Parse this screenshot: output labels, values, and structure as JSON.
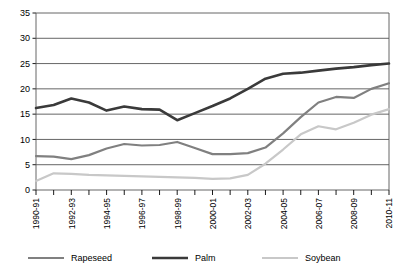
{
  "chart_data": {
    "type": "line",
    "title": "",
    "subtitle": "",
    "xlabel": "",
    "ylabel": "",
    "ylim": [
      0,
      35
    ],
    "ytick_values": [
      0,
      5,
      10,
      15,
      20,
      25,
      30,
      35
    ],
    "ytick_labels": [
      "0",
      "5",
      "10",
      "15",
      "20",
      "25",
      "30",
      "35"
    ],
    "grid": true,
    "legend_position": "bottom",
    "x": [
      "1990-91",
      "1991-92",
      "1992-93",
      "1993-94",
      "1994-95",
      "1995-96",
      "1996-97",
      "1997-98",
      "1998-99",
      "1999-00",
      "2000-01",
      "2001-02",
      "2002-03",
      "2003-04",
      "2004-05",
      "2005-06",
      "2006-07",
      "2007-08",
      "2008-09",
      "2009-10",
      "2010-11"
    ],
    "xtick_labels_shown": [
      "1990-91",
      "1992-93",
      "1994-95",
      "1996-97",
      "1998-99",
      "2000-01",
      "2002-03",
      "2004-05",
      "2006-07",
      "2008-09",
      "2010-11"
    ],
    "series": [
      {
        "name": "Rapeseed",
        "color": "#808080",
        "values": [
          6.7,
          6.6,
          6.1,
          6.9,
          8.2,
          9.1,
          8.8,
          8.9,
          9.5,
          8.3,
          7.1,
          7.1,
          7.3,
          8.4,
          11.2,
          14.4,
          17.3,
          18.4,
          18.2,
          20.0,
          21.1
        ]
      },
      {
        "name": "Palm",
        "color": "#3a3a3a",
        "values": [
          16.2,
          16.8,
          18.1,
          17.3,
          15.7,
          16.5,
          16.0,
          15.9,
          13.8,
          15.2,
          16.6,
          18.1,
          20.0,
          22.0,
          23.0,
          23.2,
          23.6,
          24.0,
          24.3,
          24.7,
          25.0
        ]
      },
      {
        "name": "Soybean",
        "color": "#c8c8c8",
        "values": [
          1.8,
          3.3,
          3.2,
          3.0,
          2.9,
          2.8,
          2.7,
          2.6,
          2.5,
          2.4,
          2.2,
          2.3,
          3.0,
          5.2,
          8.0,
          11.0,
          12.6,
          12.0,
          13.3,
          14.9,
          16.0
        ]
      }
    ],
    "legend": [
      {
        "label": "Rapeseed",
        "color": "#808080"
      },
      {
        "label": "Palm",
        "color": "#3a3a3a"
      },
      {
        "label": "Soybean",
        "color": "#c8c8c8"
      }
    ]
  }
}
